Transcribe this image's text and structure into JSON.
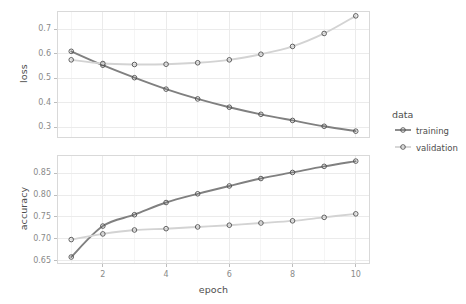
{
  "chart_data": {
    "type": "line",
    "title": "",
    "xlabel": "epoch",
    "ylabel": "",
    "facets": [
      {
        "name": "loss",
        "ylabel": "loss",
        "ylim": [
          0.255,
          0.775
        ],
        "yticks": [
          0.3,
          0.4,
          0.5,
          0.6,
          0.7
        ],
        "ytick_labels": [
          "0.3",
          "0.4",
          "0.5",
          "0.6",
          "0.7"
        ],
        "series": [
          {
            "name": "training",
            "color": "#808080",
            "values": [
              0.61,
              0.553,
              0.502,
              0.455,
              0.415,
              0.381,
              0.352,
              0.327,
              0.303,
              0.283
            ]
          },
          {
            "name": "validation",
            "color": "#d3d3d3",
            "values": [
              0.575,
              0.56,
              0.556,
              0.557,
              0.563,
              0.575,
              0.598,
              0.63,
              0.683,
              0.755
            ]
          }
        ]
      },
      {
        "name": "accuracy",
        "ylabel": "accuracy",
        "ylim": [
          0.642,
          0.892
        ],
        "yticks": [
          0.65,
          0.7,
          0.75,
          0.8,
          0.85
        ],
        "ytick_labels": [
          "0.65",
          "0.70",
          "0.75",
          "0.80",
          "0.85"
        ],
        "series": [
          {
            "name": "training",
            "color": "#808080",
            "values": [
              0.658,
              0.729,
              0.755,
              0.783,
              0.803,
              0.821,
              0.838,
              0.852,
              0.866,
              0.878
            ]
          },
          {
            "name": "validation",
            "color": "#d3d3d3",
            "values": [
              0.698,
              0.711,
              0.72,
              0.723,
              0.727,
              0.731,
              0.736,
              0.741,
              0.749,
              0.757
            ]
          }
        ]
      }
    ],
    "x": [
      1,
      2,
      3,
      4,
      5,
      6,
      7,
      8,
      9,
      10
    ],
    "xlim": [
      0.55,
      10.45
    ],
    "xticks": [
      2,
      4,
      6,
      8,
      10
    ],
    "xtick_labels": [
      "2",
      "4",
      "6",
      "8",
      "10"
    ],
    "grid": true,
    "legend": {
      "title": "data",
      "position": "right",
      "entries": [
        {
          "label": "training",
          "color": "#808080"
        },
        {
          "label": "validation",
          "color": "#d3d3d3"
        }
      ]
    }
  },
  "theme": {
    "panel_background": "#ffffff",
    "panel_border": "#d9d9d9",
    "grid_major": "#ebebeb",
    "grid_minor": "#f5f5f5",
    "text_color": "#4d4d4d",
    "tick_text_color": "#8a8a8a",
    "point_stroke": "#4d4d4d"
  }
}
